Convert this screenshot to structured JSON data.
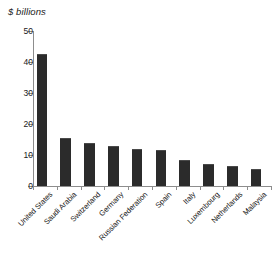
{
  "chart_data": {
    "type": "bar",
    "title": "$ billions",
    "xlabel": "",
    "ylabel": "",
    "ylim": [
      0,
      50
    ],
    "yticks": [
      0,
      10,
      20,
      30,
      40,
      50
    ],
    "ytick_labels": [
      "0",
      "10",
      "20",
      "30",
      "40",
      "50"
    ],
    "grid": false,
    "legend": null,
    "bar_color": "#2b2b2b",
    "axis_color": "#8d8d8d",
    "categories": [
      "United States",
      "Saudi Arabia",
      "Switzerland",
      "Germany",
      "Russian Federation",
      "Spain",
      "Italy",
      "Luxembourg",
      "Netherlands",
      "Malaysia"
    ],
    "values": [
      42.5,
      15.5,
      14.0,
      12.8,
      12.0,
      11.5,
      8.5,
      7.0,
      6.3,
      5.5
    ]
  }
}
